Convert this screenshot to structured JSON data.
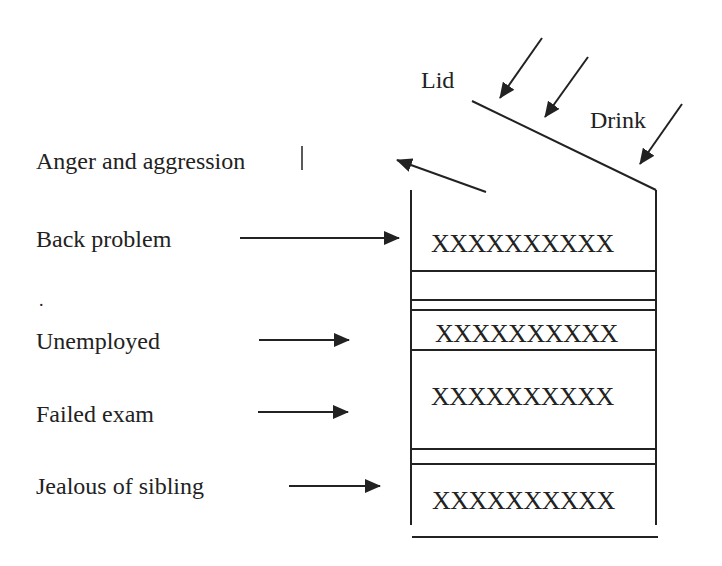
{
  "diagram": {
    "colors": {
      "ink": "#222222",
      "background": "#ffffff"
    },
    "lid_label": "Lid",
    "drink_label": "Drink",
    "output_label": "Anger and aggression",
    "inputs": [
      {
        "label": "Back problem"
      },
      {
        "label": "Unemployed"
      },
      {
        "label": "Failed exam"
      },
      {
        "label": "Jealous of sibling"
      }
    ],
    "layers": [
      {
        "content": "XXXXXXXXXX"
      },
      {
        "content": "XXXXXXXXXX"
      },
      {
        "content": "XXXXXXXXXX"
      },
      {
        "content": "XXXXXXXXXX"
      }
    ],
    "stray_mark": "."
  }
}
